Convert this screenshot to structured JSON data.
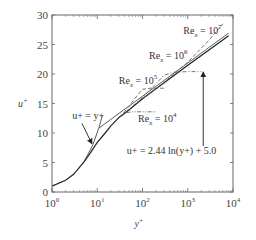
{
  "chart_data": {
    "type": "line",
    "title": "",
    "xlabel": "y+",
    "ylabel": "u+",
    "xscale": "log",
    "xlim": [
      1,
      10000
    ],
    "ylim": [
      0,
      30
    ],
    "xticks": [
      {
        "value": 1,
        "label_base": "10",
        "label_exp": "0"
      },
      {
        "value": 10,
        "label_base": "10",
        "label_exp": "1"
      },
      {
        "value": 100,
        "label_base": "10",
        "label_exp": "2"
      },
      {
        "value": 1000,
        "label_base": "10",
        "label_exp": "3"
      },
      {
        "value": 10000,
        "label_base": "10",
        "label_exp": "4"
      }
    ],
    "yticks": [
      0,
      5,
      10,
      15,
      20,
      25,
      30
    ],
    "grid": false,
    "series": [
      {
        "name": "Universal velocity profile (solid)",
        "style": "solid",
        "x": [
          1,
          2,
          3,
          5,
          7,
          10,
          15,
          20,
          30,
          50,
          100,
          300,
          1000,
          3000,
          8000
        ],
        "y": [
          1.0,
          2.0,
          3.0,
          5.0,
          6.6,
          8.4,
          10.0,
          11.2,
          12.6,
          13.9,
          15.8,
          18.5,
          21.5,
          24.1,
          26.5
        ]
      },
      {
        "name": "Viscous sublayer u+ = y+",
        "style": "solid-thin",
        "x": [
          5,
          8,
          11,
          13
        ],
        "y": [
          5,
          8,
          11,
          13
        ]
      },
      {
        "name": "Log law u+ = 2.44 ln(y+) + 5.0",
        "style": "solid-thin",
        "x": [
          11,
          30,
          100,
          1000,
          8000
        ],
        "y": [
          10.85,
          13.3,
          16.24,
          21.86,
          26.93
        ]
      },
      {
        "name": "Re_x = 10^4",
        "style": "dash-dot-dot",
        "x": [
          20,
          30,
          40,
          60,
          100,
          200
        ],
        "y": [
          11.2,
          12.6,
          13.4,
          13.6,
          13.6,
          13.6
        ]
      },
      {
        "name": "Re_x = 10^5",
        "style": "dashed",
        "x": [
          20,
          40,
          70,
          100,
          150,
          300
        ],
        "y": [
          11.2,
          13.6,
          16.0,
          17.4,
          17.6,
          17.6
        ]
      },
      {
        "name": "Re_x = 10^6",
        "style": "dash-dot",
        "x": [
          30,
          100,
          300,
          500,
          1000,
          2000
        ],
        "y": [
          12.6,
          16.0,
          19.8,
          20.3,
          20.4,
          20.4
        ]
      },
      {
        "name": "Re_x = 10^7",
        "style": "dashed",
        "x": [
          100,
          300,
          1000,
          3000,
          6000
        ],
        "y": [
          15.8,
          18.6,
          22.0,
          25.8,
          28.5
        ]
      }
    ],
    "annotations": [
      {
        "text_base": "Re",
        "text_sub": "x",
        "text_eq": " = 10",
        "text_exp": "7",
        "x": 800,
        "y": 26.8
      },
      {
        "text_base": "Re",
        "text_sub": "x",
        "text_eq": " = 10",
        "text_exp": "6",
        "x": 140,
        "y": 22.5
      },
      {
        "text_base": "Re",
        "text_sub": "x",
        "text_eq": " = 10",
        "text_exp": "5",
        "x": 30,
        "y": 18.3
      },
      {
        "text_base": "Re",
        "text_sub": "x",
        "text_eq": " = 10",
        "text_exp": "4",
        "x": 80,
        "y": 11.8
      },
      {
        "text": "u+ = y+",
        "x": 2.8,
        "y": 12.4
      },
      {
        "text": "u+ = 2.44 ln(y+) + 5.0",
        "x": 45,
        "y": 6.4
      }
    ],
    "arrows": [
      {
        "name": "arrow-to-viscous-sublayer",
        "from": [
          4.6,
          11.6
        ],
        "to": [
          7.6,
          8.2
        ]
      },
      {
        "name": "arrow-to-log-law",
        "from": [
          2200,
          7.8
        ],
        "to": [
          2200,
          20.3
        ]
      }
    ]
  },
  "labels": {
    "ylabel_base": "u",
    "ylabel_sup": "+",
    "xlabel_base": "y",
    "xlabel_sup": "+"
  }
}
